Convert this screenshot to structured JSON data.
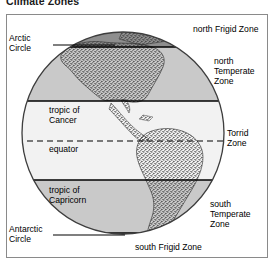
{
  "title": "Climate Zones",
  "figure": {
    "labels": {
      "arctic_circle": "Arctic\nCircle",
      "north_frigid_zone": "north Frigid Zone",
      "north_temperate_zone": "north\nTemperate\nZone",
      "tropic_of_cancer": "tropic of\nCancer",
      "equator": "equator",
      "torrid_zone": "Torrid\nZone",
      "tropic_of_capricorn": "tropic of\nCapricorn",
      "south_temperate_zone": "south\nTemperate\nZone",
      "antarctic_circle": "Antarctic\nCircle",
      "south_frigid_zone": "south Frigid Zone"
    },
    "colors": {
      "frigid_zone_fill": "#8e8e8e",
      "temperate_zone_fill": "#c9c9c9",
      "torrid_zone_fill": "#f2f2f2",
      "globe_outline": "#3d3d3d",
      "latitude_line": "#000000",
      "frame_border": "#8a8a8a",
      "land_stipple": "#2b2b2b",
      "background": "#ffffff"
    },
    "latitude_lines": [
      {
        "name": "arctic-circle",
        "style": "solid"
      },
      {
        "name": "tropic-of-cancer",
        "style": "solid"
      },
      {
        "name": "equator",
        "style": "dashed"
      },
      {
        "name": "tropic-of-capricorn",
        "style": "solid"
      },
      {
        "name": "antarctic-circle",
        "style": "solid"
      }
    ]
  }
}
